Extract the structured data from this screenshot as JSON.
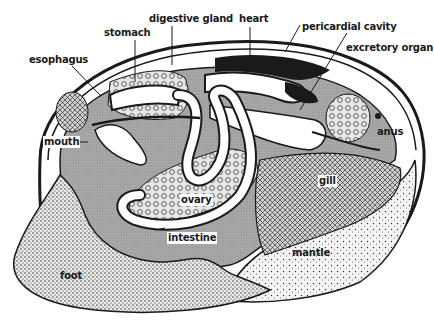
{
  "diagram": {
    "labels": {
      "esophagus": "esophagus",
      "stomach": "stomach",
      "digestive_gland": "digestive gland",
      "heart": "heart",
      "pericardial_cavity": "pericardial cavity",
      "excretory_organ": "excretory organ",
      "anus": "anus",
      "mouth": "mouth",
      "gill": "gill",
      "ovary": "ovary",
      "intestine": "intestine",
      "foot": "foot",
      "mantle": "mantle"
    },
    "colors": {
      "ink": "#1a1a1a",
      "body_gray": "#b8b8b8",
      "visceral_gray": "#9e9e9e",
      "paper": "#ffffff"
    }
  }
}
